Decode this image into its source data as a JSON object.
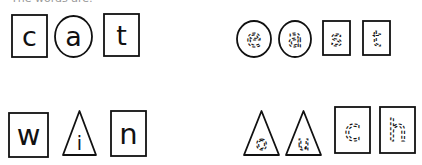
{
  "header": {
    "instruction_text": "The words are:"
  },
  "colors": {
    "ink": "#111111",
    "background": "#ffffff"
  },
  "words": [
    {
      "word": "cat",
      "style": "solid",
      "tiles": [
        {
          "letter": "c",
          "shape": "square",
          "x": 11,
          "y": 14,
          "w": 37,
          "h": 44
        },
        {
          "letter": "a",
          "shape": "circle",
          "x": 54,
          "y": 15,
          "w": 39,
          "h": 43
        },
        {
          "letter": "t",
          "shape": "square",
          "x": 103,
          "y": 13,
          "w": 37,
          "h": 44
        }
      ]
    },
    {
      "word": "east",
      "style": "dashed",
      "tiles": [
        {
          "letter": "e",
          "shape": "circle",
          "x": 236,
          "y": 20,
          "w": 36,
          "h": 38
        },
        {
          "letter": "a",
          "shape": "circle",
          "x": 278,
          "y": 20,
          "w": 34,
          "h": 38
        },
        {
          "letter": "s",
          "shape": "square",
          "x": 322,
          "y": 20,
          "w": 29,
          "h": 36
        },
        {
          "letter": "t",
          "shape": "square",
          "x": 362,
          "y": 20,
          "w": 29,
          "h": 36
        }
      ]
    },
    {
      "word": "win",
      "style": "solid",
      "tiles": [
        {
          "letter": "w",
          "shape": "square",
          "x": 8,
          "y": 112,
          "w": 41,
          "h": 46
        },
        {
          "letter": "i",
          "shape": "triangle",
          "x": 62,
          "y": 110,
          "w": 35,
          "h": 46
        },
        {
          "letter": "n",
          "shape": "square",
          "x": 110,
          "y": 110,
          "w": 37,
          "h": 47
        }
      ]
    },
    {
      "word": "ouch",
      "style": "dashed",
      "tiles": [
        {
          "letter": "o",
          "shape": "triangle",
          "x": 243,
          "y": 110,
          "w": 37,
          "h": 46
        },
        {
          "letter": "u",
          "shape": "triangle",
          "x": 285,
          "y": 110,
          "w": 37,
          "h": 46
        },
        {
          "letter": "c",
          "shape": "square",
          "x": 334,
          "y": 106,
          "w": 37,
          "h": 48
        },
        {
          "letter": "h",
          "shape": "square",
          "x": 379,
          "y": 106,
          "w": 37,
          "h": 48
        }
      ]
    }
  ]
}
